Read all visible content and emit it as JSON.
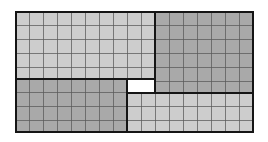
{
  "diagram": {
    "grid_cell_size": 14,
    "colors": {
      "light_fill": "#cdcdcd",
      "dark_fill": "#a9a9a9",
      "hole_fill": "#ffffff",
      "border": "#151515",
      "gridline": "#5a5a5a"
    },
    "outer": {
      "x": 15,
      "y": 11,
      "w": 239,
      "h": 122
    },
    "regions": [
      {
        "name": "top-left",
        "shade": "light",
        "x": 15,
        "y": 11,
        "w": 141,
        "h": 68
      },
      {
        "name": "top-right",
        "shade": "dark",
        "x": 155,
        "y": 11,
        "w": 99,
        "h": 82
      },
      {
        "name": "bottom-left",
        "shade": "dark",
        "x": 15,
        "y": 78,
        "w": 113,
        "h": 55
      },
      {
        "name": "bottom-right",
        "shade": "light",
        "x": 127,
        "y": 92,
        "w": 127,
        "h": 41
      }
    ],
    "hole": {
      "x": 127,
      "y": 78,
      "w": 29,
      "h": 15
    }
  }
}
